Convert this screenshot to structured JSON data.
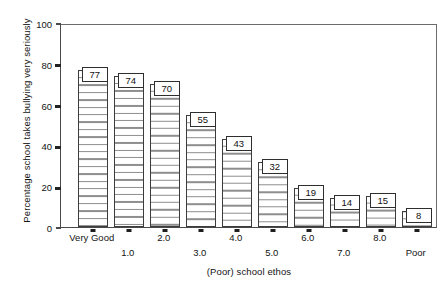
{
  "chart_data": {
    "type": "bar",
    "title": "",
    "xlabel": "(Poor) school ethos",
    "ylabel": "Percentage school takes bullying very seriously",
    "categories": [
      "Very Good",
      "1.0",
      "2.0",
      "3.0",
      "4.0",
      "5.0",
      "6.0",
      "7.0",
      "8.0",
      "Poor"
    ],
    "values": [
      77,
      74,
      70,
      55,
      43,
      32,
      19,
      14,
      15,
      8
    ],
    "ylim": [
      0,
      100
    ],
    "yticks": [
      0,
      20,
      40,
      60,
      80,
      100
    ],
    "ytick_labels": [
      "0",
      "20",
      "40",
      "60",
      "80",
      "100"
    ],
    "grid": false,
    "legend": null,
    "bar_style": {
      "fill": "#ffffff",
      "hatch": "horizontal-lines",
      "hatch_color": "#8e8e8e",
      "edge_color": "#3c3c3c"
    },
    "axis_color": "#4a4a4a",
    "text_color": "#141414"
  }
}
